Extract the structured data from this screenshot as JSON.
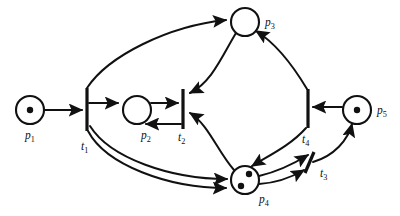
{
  "diagram": {
    "type": "petri-net",
    "title": "",
    "background_color": "#ffffff",
    "stroke_color": "#111111",
    "places": [
      {
        "id": "p1",
        "label": "p",
        "subscript": "1",
        "tokens": 1,
        "cx": 30,
        "cy": 110,
        "r": 14,
        "label_x": 25,
        "label_y": 139
      },
      {
        "id": "p2",
        "label": "p",
        "subscript": "2",
        "tokens": 0,
        "cx": 137,
        "cy": 110,
        "r": 14,
        "label_x": 141,
        "label_y": 139
      },
      {
        "id": "p3",
        "label": "p",
        "subscript": "3",
        "tokens": 0,
        "cx": 245,
        "cy": 22,
        "r": 14,
        "label_x": 265,
        "label_y": 26
      },
      {
        "id": "p4",
        "label": "p",
        "subscript": "4",
        "tokens": 2,
        "cx": 245,
        "cy": 180,
        "r": 14,
        "label_x": 259,
        "label_y": 203
      },
      {
        "id": "p5",
        "label": "p",
        "subscript": "5",
        "tokens": 1,
        "cx": 357,
        "cy": 110,
        "r": 14,
        "label_x": 377,
        "label_y": 114
      }
    ],
    "transitions": [
      {
        "id": "t1",
        "label": "t",
        "subscript": "1",
        "x1": 87,
        "y1": 88,
        "x2": 87,
        "y2": 131,
        "label_x": 81,
        "label_y": 150
      },
      {
        "id": "t2",
        "label": "t",
        "subscript": "2",
        "x1": 183,
        "y1": 89,
        "x2": 183,
        "y2": 129,
        "label_x": 178,
        "label_y": 141
      },
      {
        "id": "t3",
        "label": "t",
        "subscript": "3",
        "x1": 314,
        "y1": 152,
        "x2": 305,
        "y2": 173,
        "label_x": 320,
        "label_y": 177
      },
      {
        "id": "t4",
        "label": "t",
        "subscript": "4",
        "x1": 308,
        "y1": 89,
        "x2": 308,
        "y2": 128,
        "label_x": 302,
        "label_y": 143
      }
    ],
    "arcs": [
      {
        "from": "p1",
        "to": "t1",
        "weight": 1,
        "style": "straight"
      },
      {
        "from": "t1",
        "to": "p2",
        "weight": 1,
        "style": "straight"
      },
      {
        "from": "t1",
        "to": "p3",
        "weight": 1,
        "style": "curved"
      },
      {
        "from": "t1",
        "to": "p4",
        "weight": 2,
        "style": "curved-double"
      },
      {
        "from": "p2",
        "to": "t2",
        "weight": 1,
        "style": "straight"
      },
      {
        "from": "t2",
        "to": "p2",
        "weight": 1,
        "style": "straight"
      },
      {
        "from": "p3",
        "to": "t2",
        "weight": 1,
        "style": "curved"
      },
      {
        "from": "p4",
        "to": "t2",
        "weight": 1,
        "style": "curved"
      },
      {
        "from": "p4",
        "to": "t3",
        "weight": 2,
        "style": "curved-double"
      },
      {
        "from": "t3",
        "to": "p5",
        "weight": 1,
        "style": "curved"
      },
      {
        "from": "p5",
        "to": "t4",
        "weight": 1,
        "style": "straight"
      },
      {
        "from": "t4",
        "to": "p3",
        "weight": 1,
        "style": "curved"
      },
      {
        "from": "t4",
        "to": "p4",
        "weight": 1,
        "style": "curved"
      }
    ]
  }
}
